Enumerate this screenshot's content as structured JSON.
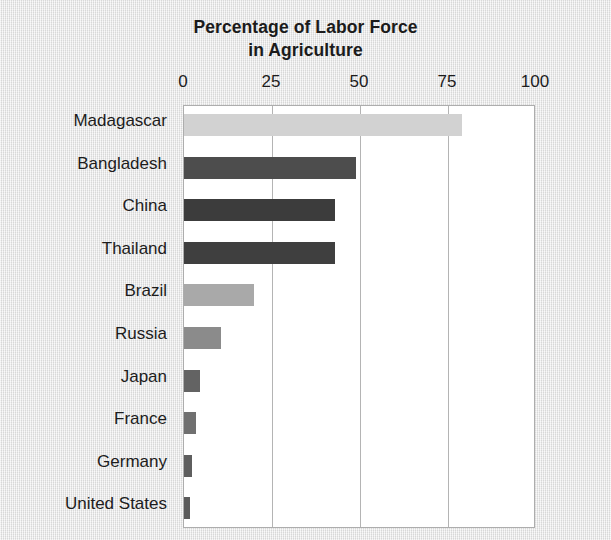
{
  "chart_data": {
    "type": "bar",
    "orientation": "horizontal",
    "title": "Percentage of Labor Force in Agriculture",
    "title_line1": "Percentage of Labor Force",
    "title_line2": "in Agriculture",
    "xlabel": "",
    "ylabel": "",
    "xlim": [
      0,
      100
    ],
    "xticks": [
      0,
      25,
      50,
      75,
      100
    ],
    "xtick_labels": [
      "0",
      "25",
      "50",
      "75",
      "100"
    ],
    "grid": "vertical",
    "legend": "none",
    "categories": [
      "Madagascar",
      "Bangladesh",
      "China",
      "Thailand",
      "Brazil",
      "Russia",
      "Japan",
      "France",
      "Germany",
      "United States"
    ],
    "values": [
      79,
      49,
      43,
      43,
      20,
      10.5,
      4.5,
      3.5,
      2.3,
      1.7
    ],
    "bar_colors": [
      "#d2d2d2",
      "#4d4d4d",
      "#3c3c3c",
      "#3f3f3f",
      "#a9a9a9",
      "#8b8b8b",
      "#636363",
      "#707070",
      "#5e5e5e",
      "#5a5a5a"
    ]
  },
  "style": {
    "page_background": "#e8e8e8",
    "plot_background": "#ffffff",
    "plot_border_color": "#adadad",
    "gridline_color": "#b4b4b4",
    "text_color": "#1c1c1c"
  }
}
